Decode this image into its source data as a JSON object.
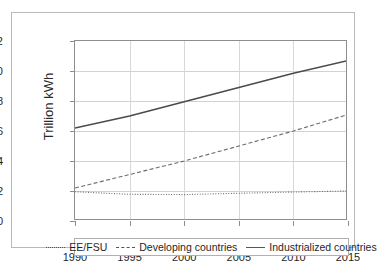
{
  "chart_data": {
    "type": "line",
    "title": "",
    "subtitle": "",
    "xlabel": "",
    "ylabel": "Trillion kWh",
    "xlim": [
      1990,
      2015
    ],
    "ylim": [
      0,
      12
    ],
    "xticks": [
      "1990",
      "1995",
      "2000",
      "2005",
      "2010",
      "2015"
    ],
    "yticks": [
      "0",
      "2",
      "4",
      "6",
      "8",
      "10",
      "12"
    ],
    "grid": true,
    "legend_position": "bottom",
    "x": [
      1990,
      1995,
      2000,
      2005,
      2010,
      2015
    ],
    "series": [
      {
        "name": "EE/FSU",
        "style": "dotted",
        "color": "#6b6b6b",
        "values": [
          1.95,
          1.78,
          1.76,
          1.85,
          1.93,
          2.0
        ]
      },
      {
        "name": "Developing countries",
        "style": "dashed",
        "color": "#6b6b6b",
        "values": [
          2.2,
          3.1,
          4.0,
          5.0,
          6.0,
          7.1
        ]
      },
      {
        "name": "Industrialized countries",
        "style": "solid",
        "color": "#4a4a4a",
        "values": [
          6.2,
          7.0,
          7.95,
          8.9,
          9.85,
          10.7
        ]
      }
    ]
  },
  "axis": {
    "y_title": "Trillion kWh",
    "y_tick_labels": [
      "12",
      "10",
      "8",
      "6",
      "4",
      "2",
      "0"
    ],
    "x_tick_labels": [
      "1990",
      "1995",
      "2000",
      "2005",
      "2010",
      "2015"
    ]
  },
  "legend": {
    "items": [
      {
        "label": "EE/FSU",
        "style": "dotted"
      },
      {
        "label": "Developing countries",
        "style": "dashed"
      },
      {
        "label": "Industrialized countries",
        "style": "solid"
      }
    ]
  },
  "colors": {
    "frame": "#b9b9b9",
    "axis": "#8e8e8e",
    "grid": "#d2d2d2",
    "text": "#1f1f1f",
    "line": "#4a4a4a"
  }
}
